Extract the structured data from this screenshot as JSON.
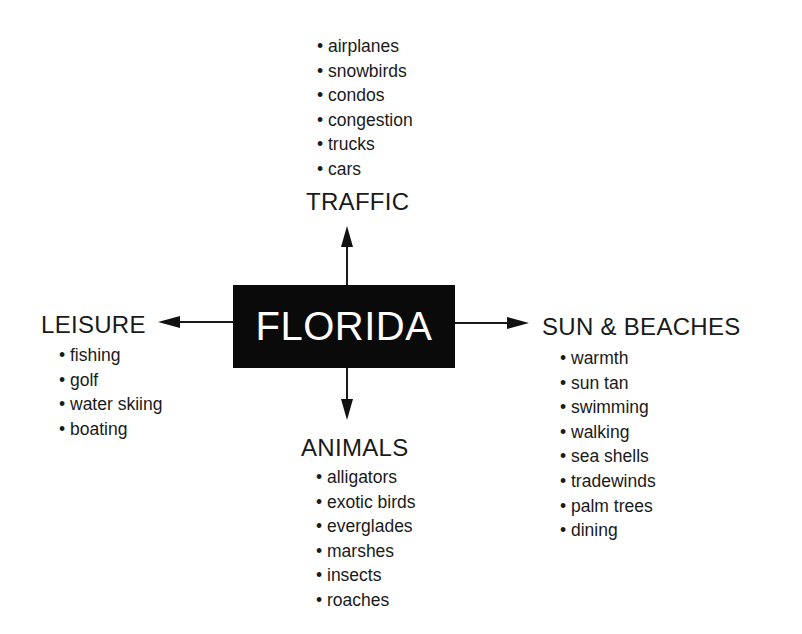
{
  "center": {
    "label": "FLORIDA"
  },
  "branches": {
    "traffic": {
      "title": "TRAFFIC",
      "items": [
        "airplanes",
        "snowbirds",
        "condos",
        "congestion",
        "trucks",
        "cars"
      ]
    },
    "leisure": {
      "title": "LEISURE",
      "items": [
        "fishing",
        "golf",
        "water skiing",
        "boating"
      ]
    },
    "sun_beaches": {
      "title": "SUN & BEACHES",
      "items": [
        "warmth",
        "sun tan",
        "swimming",
        "walking",
        "sea shells",
        "tradewinds",
        "palm trees",
        "dining"
      ]
    },
    "animals": {
      "title": "ANIMALS",
      "items": [
        "alligators",
        "exotic birds",
        "everglades",
        "marshes",
        "insects",
        "roaches"
      ]
    }
  }
}
